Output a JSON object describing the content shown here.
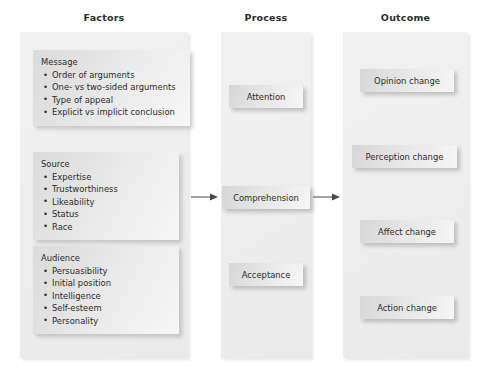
{
  "diagram": {
    "columns": [
      {
        "id": "factors",
        "header": "Factors"
      },
      {
        "id": "process",
        "header": "Process"
      },
      {
        "id": "outcome",
        "header": "Outcome"
      }
    ],
    "factors": {
      "header": "Factors",
      "groups": [
        {
          "title": "Message",
          "items": [
            "Order of arguments",
            "One- vs two-sided arguments",
            "Type of appeal",
            "Explicit vs implicit conclusion"
          ]
        },
        {
          "title": "Source",
          "items": [
            "Expertise",
            "Trustworthiness",
            "Likeability",
            "Status",
            "Race"
          ]
        },
        {
          "title": "Audience",
          "items": [
            "Persuasibility",
            "Initial position",
            "Intelligence",
            "Self-esteem",
            "Personality"
          ]
        }
      ]
    },
    "process": {
      "header": "Process",
      "nodes": [
        {
          "label": "Attention"
        },
        {
          "label": "Comprehension"
        },
        {
          "label": "Acceptance"
        }
      ]
    },
    "outcome": {
      "header": "Outcome",
      "nodes": [
        {
          "label": "Opinion change"
        },
        {
          "label": "Perception change"
        },
        {
          "label": "Affect change"
        },
        {
          "label": "Action change"
        }
      ]
    },
    "arrows": [
      {
        "id": "factors-to-process",
        "from": "factors",
        "to": "process",
        "direction": "right"
      },
      {
        "id": "process-to-outcome",
        "from": "process",
        "to": "outcome",
        "direction": "right"
      }
    ],
    "colors": {
      "page_background": "#ffffff",
      "panel_fill": "#eeeeee",
      "box_fill": "#e4e4e4",
      "text": "#2b2b2b",
      "arrow": "#4a4a4a"
    }
  }
}
